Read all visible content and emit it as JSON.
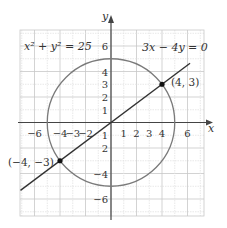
{
  "diagram": {
    "axes": {
      "x_label": "x",
      "y_label": "y",
      "x_ticks": [
        {
          "value": -6,
          "label": "−6"
        },
        {
          "value": -4,
          "label": "−4"
        },
        {
          "value": -3,
          "label": "−3"
        },
        {
          "value": -2,
          "label": "−2"
        },
        {
          "value": 1,
          "label": "1"
        },
        {
          "value": 2,
          "label": "2"
        },
        {
          "value": 3,
          "label": "3"
        },
        {
          "value": 4,
          "label": "4"
        },
        {
          "value": 6,
          "label": "6"
        }
      ],
      "y_ticks": [
        {
          "value": 6,
          "label": "6"
        },
        {
          "value": 4,
          "label": "4"
        },
        {
          "value": 3,
          "label": "3"
        },
        {
          "value": 2,
          "label": "2"
        },
        {
          "value": 1,
          "label": "1"
        },
        {
          "value": -1,
          "label": "1"
        },
        {
          "value": -2,
          "label": "2"
        },
        {
          "value": -4,
          "label": "−4"
        },
        {
          "value": -6,
          "label": "−6"
        }
      ],
      "range": {
        "xmin": -7,
        "xmax": 7,
        "ymin": -7,
        "ymax": 7
      }
    },
    "circle": {
      "label": "x² + y² = 25",
      "radius": 5,
      "color": "#7a7a7a"
    },
    "line": {
      "label": "3x − 4y = 0",
      "slope": 0.75,
      "color": "#333333"
    },
    "points": [
      {
        "x": 4,
        "y": 3,
        "label": "(4, 3)"
      },
      {
        "x": -4,
        "y": -3,
        "label": "(−4, −3)"
      }
    ],
    "colors": {
      "grid_major": "#c8c8c8",
      "grid_minor": "#e2e2e2",
      "axis": "#444444",
      "text": "#333333"
    }
  }
}
